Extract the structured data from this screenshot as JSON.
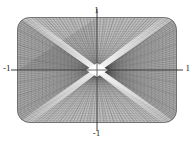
{
  "figure": {
    "name": "mesh-surface-plot",
    "background_color": "#ffffff",
    "width": 193,
    "height": 142
  },
  "axes": {
    "top_label": "1",
    "bottom_label": "-1",
    "left_label": "-1",
    "right_label": "1",
    "tick_color": "#2b2b2b"
  },
  "chart_data": {
    "type": "line",
    "title": "",
    "subtitle": "",
    "xlabel": "",
    "ylabel": "",
    "xlim": [
      -1,
      1
    ],
    "ylim": [
      -1,
      1
    ],
    "xticks": [
      -1,
      1
    ],
    "yticks": [
      -1,
      1
    ],
    "xtick_labels": [
      "-1",
      "1"
    ],
    "ytick_labels": [
      "-1",
      "1"
    ],
    "grid": false,
    "legend": "none",
    "render": {
      "mesh_u_lines": 46,
      "mesh_v_lines": 46,
      "mesh_stroke_color": "#3d3d3d",
      "mesh_stroke_width": 0.34,
      "mesh_opacity": 0.72,
      "highlight_color": "#ffffff",
      "shade_dark": "#6d6d6d",
      "shade_mid": "#9a9a9a",
      "shade_light": "#d8d8d8",
      "corner_radius": 12,
      "plot_left": 17,
      "plot_top": 17,
      "plot_width": 160,
      "plot_height": 106
    },
    "series": [
      {
        "name": "mesh-surface",
        "x": [
          -1,
          -0.5,
          0,
          0.5,
          1
        ],
        "values": [
          -1,
          -0.5,
          0,
          0.5,
          1
        ]
      }
    ]
  }
}
